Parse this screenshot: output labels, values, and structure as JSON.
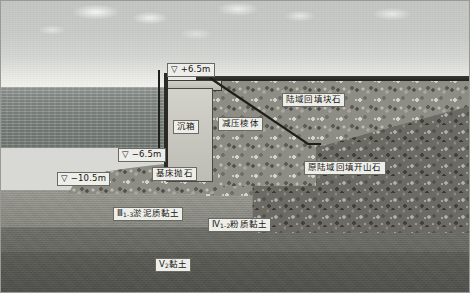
{
  "figure": {
    "width": 470,
    "height": 293
  },
  "elevations": [
    {
      "id": "top",
      "symbol": "▽",
      "value": "+6.5m",
      "text": "▽ +6.5m"
    },
    {
      "id": "mid",
      "symbol": "▽",
      "value": "−6.5m",
      "text": "▽ −6.5m"
    },
    {
      "id": "bottom",
      "symbol": "▽",
      "value": "−10.5m",
      "text": "▽ −10.5m"
    }
  ],
  "structures": {
    "caisson": "沉箱",
    "relief_prism": "减压棱体",
    "bedding_riprap": "基床抛石",
    "land_backfill_block_stone": "陆域回填块石",
    "original_land_backfill_blast_rock": "原陆域回填开山石"
  },
  "strata": [
    {
      "code": "Ⅲ",
      "sub": "1-3",
      "name": "淤泥质黏土",
      "label": "Ⅲ1-3淤泥质黏土"
    },
    {
      "code": "Ⅳ",
      "sub": "1-2",
      "name": "粉质黏土",
      "label": "Ⅳ1-2粉质黏土"
    },
    {
      "code": "Ⅴ",
      "sub": "2",
      "name": "黏土",
      "label": "Ⅴ2黏土"
    }
  ],
  "colors": {
    "sky": "#c8cbc8",
    "sea": "#848b86",
    "rockfill_light": "#8d8c85",
    "rockfill_dark": "#6b6a64",
    "caisson": "#c9c9c2",
    "stratum_3": "#8e8e87",
    "stratum_4": "#66665f",
    "stratum_5": "#55554f",
    "label_bg": "#ededea",
    "line": "#23231f"
  }
}
